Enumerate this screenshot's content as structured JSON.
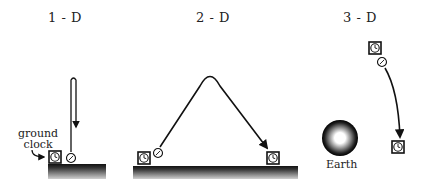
{
  "panels": [
    {
      "title": "1 - D",
      "annotation": [
        "ground",
        "clock"
      ]
    },
    {
      "title": "2 - D"
    },
    {
      "title": "3 - D",
      "body_label": "Earth"
    }
  ],
  "colors": {
    "ink": "#1a1a1a",
    "ground_top": "#1a1a1a",
    "ground_bottom": "#bdbdbd"
  }
}
